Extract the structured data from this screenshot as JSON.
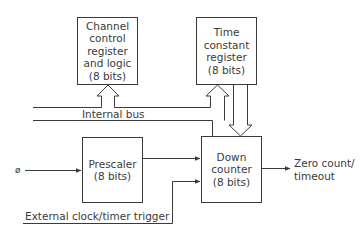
{
  "diagram": {
    "type": "block-diagram",
    "blocks": {
      "channel_control": {
        "lines": [
          "Channel",
          "control",
          "register",
          "and logic",
          "(8 bits)"
        ]
      },
      "time_constant": {
        "lines": [
          "Time",
          "constant",
          "register",
          "(8 bits)"
        ]
      },
      "prescaler": {
        "lines": [
          "Prescaler",
          "(8 bits)"
        ]
      },
      "down_counter": {
        "lines": [
          "Down",
          "counter",
          "(8 bits)"
        ]
      }
    },
    "labels": {
      "internal_bus": "Internal bus",
      "clock_input": "ø",
      "external_trigger": "External clock/timer trigger",
      "output_line1": "Zero count/",
      "output_line2": "timeout"
    },
    "connections": [
      {
        "from": "internal_bus",
        "to": "channel_control",
        "style": "hollow-bus-arrow"
      },
      {
        "from": "internal_bus",
        "to": "time_constant",
        "style": "hollow-bus-arrow"
      },
      {
        "from": "time_constant",
        "to": "down_counter",
        "style": "hollow-bus-arrow"
      },
      {
        "from": "internal_bus",
        "to": "down_counter",
        "style": "line"
      },
      {
        "from": "clock_input",
        "to": "prescaler",
        "style": "arrow"
      },
      {
        "from": "prescaler",
        "to": "down_counter",
        "style": "arrow"
      },
      {
        "from": "external_trigger",
        "to": "down_counter",
        "style": "arrow"
      },
      {
        "from": "down_counter",
        "to": "output",
        "style": "arrow"
      }
    ],
    "colors": {
      "stroke": "#3a3a3a",
      "background": "#ffffff"
    }
  }
}
